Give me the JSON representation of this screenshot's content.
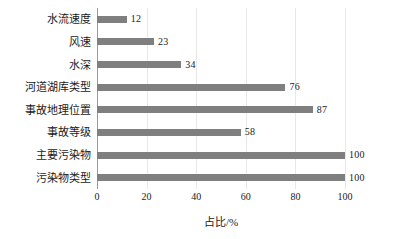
{
  "chart_data": {
    "type": "bar",
    "orientation": "horizontal",
    "title": "",
    "xlabel": "占比/%",
    "ylabel": "",
    "xlim": [
      0,
      100
    ],
    "xticks": [
      "0",
      "20",
      "40",
      "60",
      "80",
      "100"
    ],
    "xtick_values": [
      0,
      20,
      40,
      60,
      80,
      100
    ],
    "grid": true,
    "grid_axis": "x",
    "legend": false,
    "bar_color": "#7f7f7f",
    "categories": [
      "水流速度",
      "风速",
      "水深",
      "河道湖库类型",
      "事故地理位置",
      "事故等级",
      "主要污染物",
      "污染物类型"
    ],
    "values": [
      12,
      23,
      34,
      76,
      87,
      58,
      100,
      100
    ],
    "value_labels": [
      "12",
      "23",
      "34",
      "76",
      "87",
      "58",
      "100",
      "100"
    ]
  }
}
